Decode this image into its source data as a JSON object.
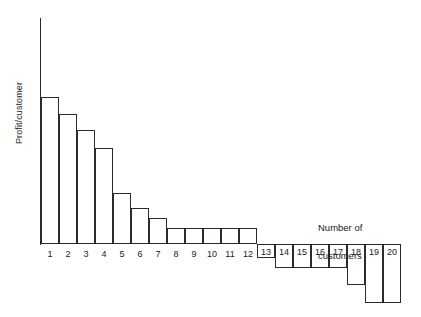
{
  "chart_data": {
    "type": "bar",
    "title": "",
    "subtitle": "",
    "xlabel": "Number of customers",
    "ylabel": "Profit/customer",
    "categories": [
      "1",
      "2",
      "3",
      "4",
      "5",
      "6",
      "7",
      "8",
      "9",
      "10",
      "11",
      "12",
      "13",
      "14",
      "15",
      "16",
      "17",
      "18",
      "19",
      "20"
    ],
    "values": [
      147,
      130,
      114,
      96,
      51,
      36,
      26,
      16,
      16,
      16,
      16,
      16,
      -14,
      -24,
      -24,
      -24,
      -24,
      -41,
      -59,
      -59
    ],
    "value_unit": "relative profit units (unlabeled axis)",
    "axis_note": "Y axis is unlabeled/unscaled; values estimated from pixel heights relative to the zero baseline.",
    "ylim": [
      -70,
      160
    ],
    "zero_baseline": 0,
    "grid": false,
    "legend": null,
    "bar_fill": "#ffffff",
    "bar_stroke": "#2b2b2b",
    "axis_color": "#2b2b2b",
    "background": "#ffffff"
  },
  "labels": {
    "y_axis": "Profit/customer",
    "x_axis_line1": "Number of",
    "x_axis_line2": "customers"
  }
}
